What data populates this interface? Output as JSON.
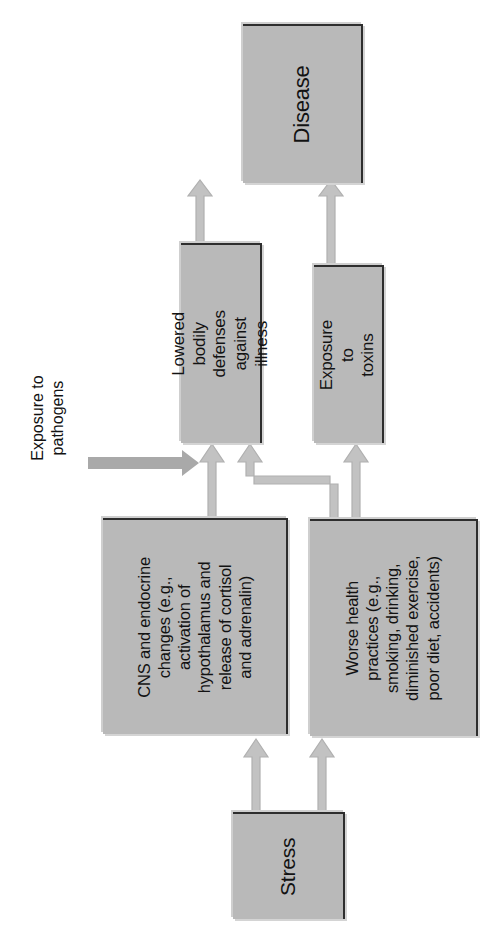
{
  "diagram": {
    "orientation": "rotated-90",
    "colors": {
      "node_fill": "#b9b9b9",
      "node_border": "#2e2e2e",
      "node_shadow": "#d4d4d4",
      "arrow_fill": "#bfbfbf",
      "arrow_outline": "#a8a8a8",
      "background": "#ffffff",
      "text": "#121212"
    },
    "nodes": [
      {
        "id": "stress",
        "label": "Stress",
        "role": "source"
      },
      {
        "id": "cns",
        "label": "CNS and endocrine\nchanges (e.g.,\nactivation of\nhypothalamus and\nrelease of cortisol\nand adrenalin)",
        "role": "mediator"
      },
      {
        "id": "practices",
        "label": "Worse health\npractices (e.g.,\nsmoking, drinking,\ndiminished exercise,\npoor diet, accidents)",
        "role": "mediator"
      },
      {
        "id": "lowered",
        "label": "Lowered bodily\ndefenses against\nillness",
        "role": "mediator"
      },
      {
        "id": "toxins",
        "label": "Exposure to\ntoxins",
        "role": "mediator"
      },
      {
        "id": "disease",
        "label": "Disease",
        "role": "outcome"
      }
    ],
    "captions": [
      {
        "id": "pathogens",
        "label": "Exposure to\npathogens",
        "note": "external input feeding into lowered bodily defenses"
      }
    ],
    "edges": [
      {
        "from": "stress",
        "to": "cns",
        "style": "block-arrow"
      },
      {
        "from": "stress",
        "to": "practices",
        "style": "block-arrow"
      },
      {
        "from": "cns",
        "to": "lowered",
        "style": "block-arrow"
      },
      {
        "from": "practices",
        "to": "lowered",
        "style": "block-arrow-elbow"
      },
      {
        "from": "practices",
        "to": "toxins",
        "style": "block-arrow"
      },
      {
        "from": "lowered",
        "to": "disease",
        "style": "block-arrow"
      },
      {
        "from": "toxins",
        "to": "disease",
        "style": "block-arrow"
      },
      {
        "from": "pathogens",
        "to": "lowered",
        "style": "plain-arrow"
      }
    ]
  }
}
